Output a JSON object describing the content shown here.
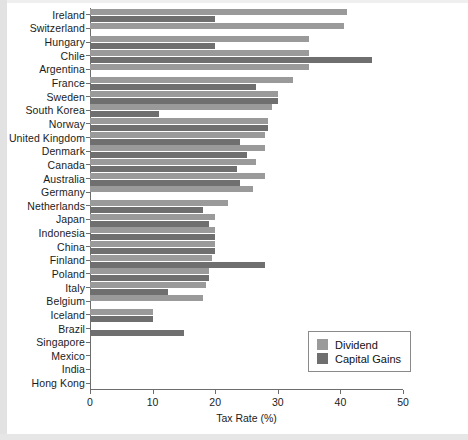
{
  "chart_data": {
    "type": "bar",
    "orientation": "horizontal",
    "title": "",
    "subtitle": "",
    "xlabel": "Tax Rate (%)",
    "ylabel": "",
    "xlim": [
      0,
      50
    ],
    "xticks": [
      0,
      10,
      20,
      30,
      40,
      50
    ],
    "grid": false,
    "legend_position": "bottom-right",
    "categories": [
      "Ireland",
      "Switzerland",
      "Hungary",
      "Chile",
      "Argentina",
      "France",
      "Sweden",
      "South Korea",
      "Norway",
      "United Kingdom",
      "Denmark",
      "Canada",
      "Australia",
      "Germany",
      "Netherlands",
      "Japan",
      "Indonesia",
      "China",
      "Finland",
      "Poland",
      "Italy",
      "Belgium",
      "Iceland",
      "Brazil",
      "Singapore",
      "Mexico",
      "India",
      "Hong Kong"
    ],
    "series": [
      {
        "name": "Dividend",
        "color": "#9a9a9a",
        "values": [
          41,
          40.5,
          35,
          35,
          35,
          32.5,
          30,
          29,
          28.5,
          28,
          28,
          26.5,
          28,
          26,
          22,
          20,
          20,
          20,
          19.5,
          19,
          18.5,
          18,
          10,
          0,
          0,
          0,
          0,
          0
        ]
      },
      {
        "name": "Capital Gains",
        "color": "#6f6f6f",
        "values": [
          20,
          0,
          20,
          45,
          0,
          26.5,
          30,
          11,
          28.5,
          24,
          25,
          23.5,
          24,
          0,
          18,
          19,
          20,
          20,
          28,
          19,
          12.5,
          0,
          10,
          15,
          0,
          0,
          0,
          0
        ]
      }
    ]
  },
  "legend": {
    "items": [
      {
        "label": "Dividend",
        "color": "#9a9a9a"
      },
      {
        "label": "Capital Gains",
        "color": "#6f6f6f"
      }
    ]
  },
  "axis": {
    "x_title": "Tax Rate (%)",
    "tick_labels": [
      "0",
      "10",
      "20",
      "30",
      "40",
      "50"
    ]
  }
}
